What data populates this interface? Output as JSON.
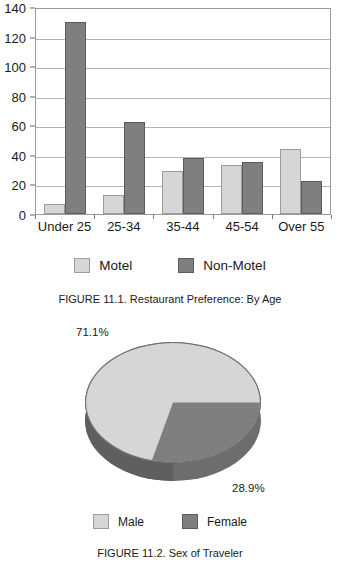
{
  "chart_data": [
    {
      "type": "bar",
      "title": "FIGURE 11.1. Restaurant Preference: By Age",
      "categories": [
        "Under 25",
        "25-34",
        "35-44",
        "45-54",
        "Over 55"
      ],
      "series": [
        {
          "name": "Motel",
          "values": [
            7,
            13,
            29,
            33,
            44
          ],
          "color": "#d6d6d6"
        },
        {
          "name": "Non-Motel",
          "values": [
            130,
            62,
            38,
            35,
            22
          ],
          "color": "#7f7f7f"
        }
      ],
      "xlabel": "",
      "ylabel": "",
      "ylim": [
        0,
        140
      ],
      "yticks": [
        0,
        20,
        40,
        60,
        80,
        100,
        120,
        140
      ],
      "grid": true,
      "legend_position": "bottom"
    },
    {
      "type": "pie",
      "title": "FIGURE 11.2. Sex of Traveler",
      "labels": [
        "Male",
        "Female"
      ],
      "values": [
        71.1,
        28.9
      ],
      "data_labels": [
        "71.1%",
        "28.9%"
      ],
      "colors": [
        "#d6d6d6",
        "#7f7f7f"
      ],
      "legend_position": "bottom",
      "three_d": true
    }
  ],
  "bar_chart": {
    "y_ticks": [
      {
        "label": "140",
        "value": 140
      },
      {
        "label": "120",
        "value": 120
      },
      {
        "label": "100",
        "value": 100
      },
      {
        "label": "80",
        "value": 80
      },
      {
        "label": "60",
        "value": 60
      },
      {
        "label": "40",
        "value": 40
      },
      {
        "label": "20",
        "value": 20
      },
      {
        "label": "0",
        "value": 0
      }
    ],
    "groups": [
      {
        "label": "Under 25",
        "motel": 7,
        "non_motel": 130
      },
      {
        "label": "25-34",
        "motel": 13,
        "non_motel": 62
      },
      {
        "label": "35-44",
        "motel": 29,
        "non_motel": 38
      },
      {
        "label": "45-54",
        "motel": 33,
        "non_motel": 35
      },
      {
        "label": "Over 55",
        "motel": 44,
        "non_motel": 22
      }
    ],
    "legend": [
      {
        "label": "Motel",
        "swatch": "light"
      },
      {
        "label": "Non-Motel",
        "swatch": "dark"
      }
    ],
    "caption": "FIGURE 11.1. Restaurant Preference: By Age"
  },
  "pie_chart": {
    "slices": [
      {
        "label": "Male",
        "percent_label": "71.1%",
        "value": 71.1,
        "swatch": "light"
      },
      {
        "label": "Female",
        "percent_label": "28.9%",
        "value": 28.9,
        "swatch": "dark"
      }
    ],
    "legend": [
      {
        "label": "Male",
        "swatch": "light"
      },
      {
        "label": "Female",
        "swatch": "dark"
      }
    ],
    "caption": "FIGURE 11.2. Sex of Traveler"
  },
  "colors": {
    "light_series": "#d6d6d6",
    "dark_series": "#7f7f7f",
    "gridline": "#b5b5b5",
    "axis": "#9a9a9a",
    "text": "#1a1a1a"
  }
}
